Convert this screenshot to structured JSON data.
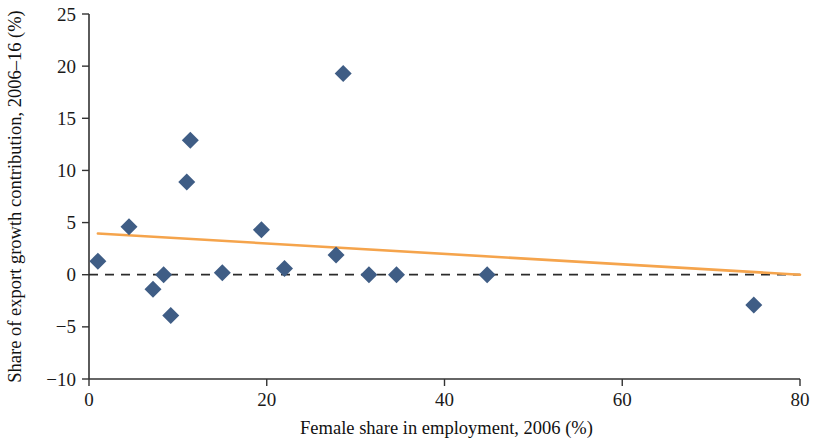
{
  "chart_data": {
    "type": "scatter",
    "title": "",
    "xlabel": "Female share in employment, 2006 (%)",
    "ylabel": "Share of export growth contribution, 2006–16 (%)",
    "xlim": [
      0,
      80
    ],
    "ylim": [
      -10,
      25
    ],
    "xticks": [
      0,
      20,
      40,
      60,
      80
    ],
    "yticks": [
      -10,
      -5,
      0,
      5,
      10,
      15,
      20,
      25
    ],
    "xtick_labels": [
      "0",
      "20",
      "40",
      "60",
      "80"
    ],
    "ytick_labels": [
      "−10",
      "−5",
      "0",
      "5",
      "10",
      "15",
      "20",
      "25"
    ],
    "grid": false,
    "legend": "none",
    "marker_shape": "diamond",
    "marker_color": "#3f5d85",
    "trend_color": "#f5a44c",
    "zero_line_color": "#2b2b2b",
    "axis_color": "#333333",
    "points": [
      {
        "x": 1.0,
        "y": 1.3
      },
      {
        "x": 4.5,
        "y": 4.6
      },
      {
        "x": 7.2,
        "y": -1.4
      },
      {
        "x": 8.4,
        "y": 0.0
      },
      {
        "x": 9.2,
        "y": -3.9
      },
      {
        "x": 11.0,
        "y": 8.9
      },
      {
        "x": 11.4,
        "y": 12.9
      },
      {
        "x": 15.0,
        "y": 0.2
      },
      {
        "x": 19.4,
        "y": 4.3
      },
      {
        "x": 22.0,
        "y": 0.6
      },
      {
        "x": 28.6,
        "y": 19.3
      },
      {
        "x": 27.8,
        "y": 1.9
      },
      {
        "x": 31.5,
        "y": 0.0
      },
      {
        "x": 34.6,
        "y": 0.0
      },
      {
        "x": 44.8,
        "y": 0.0
      },
      {
        "x": 74.8,
        "y": -2.9
      }
    ],
    "trend_series": {
      "name": "linear fit",
      "x_start": 1.0,
      "y_start": 3.95,
      "x_end": 80.0,
      "y_end": 0.0
    },
    "zero_reference": {
      "y": 0.0,
      "style": "dashed"
    }
  }
}
